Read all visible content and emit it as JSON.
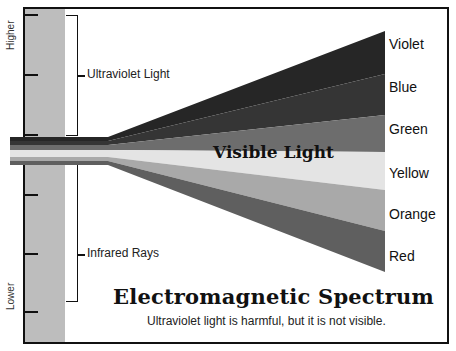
{
  "axis": {
    "top_label": "Higher",
    "bottom_label": "Lower",
    "tick_positions_y": [
      15,
      75,
      135,
      195,
      255,
      312
    ]
  },
  "brackets": {
    "upper": {
      "label": "Ultraviolet Light"
    },
    "lower": {
      "label": "Infrared Rays"
    }
  },
  "spectrum": {
    "center_label": "Visible Light",
    "bands": [
      {
        "name": "Violet",
        "color": "#262626"
      },
      {
        "name": "Blue",
        "color": "#353535"
      },
      {
        "name": "Green",
        "color": "#6d6d6d"
      },
      {
        "name": "Yellow",
        "color": "#e4e4e4"
      },
      {
        "name": "Orange",
        "color": "#a9a9a9"
      },
      {
        "name": "Red",
        "color": "#5f5f5f"
      }
    ]
  },
  "footer": {
    "title": "Electromagnetic Spectrum",
    "subtitle": "Ultraviolet light is harmful, but it is not visible."
  },
  "colors": {
    "frame": "#111111",
    "gray_band": "#bdbdbd",
    "background": "#ffffff"
  }
}
